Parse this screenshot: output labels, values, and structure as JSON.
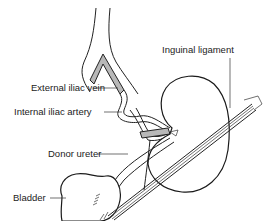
{
  "figure": {
    "type": "anatomical illustration",
    "labels": {
      "inguinal_ligament": "Inguinal ligament",
      "external_iliac_vein": "External iliac vein",
      "internal_iliac_artery": "Internal iliac artery",
      "donor_ureter": "Donor ureter",
      "bladder": "Bladder"
    }
  }
}
